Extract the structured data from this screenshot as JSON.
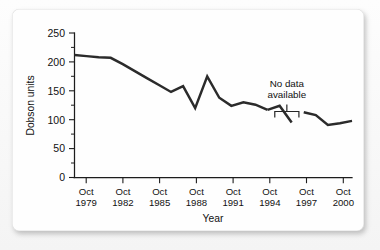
{
  "chart_data": {
    "type": "line",
    "title": "",
    "subtitle": "",
    "xlabel": "Year",
    "ylabel": "Dobson units",
    "ylim": [
      0,
      250
    ],
    "yticks": [
      0,
      50,
      100,
      150,
      200,
      250
    ],
    "ytick_labels": [
      "0",
      "50",
      "100",
      "150",
      "200",
      "250"
    ],
    "y_minor_ticks": [
      25,
      75,
      125,
      175,
      225
    ],
    "xlim": [
      1978,
      2001
    ],
    "xticks": [
      1979,
      1982,
      1985,
      1988,
      1991,
      1994,
      1997,
      2000
    ],
    "xtick_labels": [
      "Oct\n1979",
      "Oct\n1982",
      "Oct\n1985",
      "Oct\n1988",
      "Oct\n1991",
      "Oct\n1994",
      "Oct\n1997",
      "Oct\n2000"
    ],
    "xtick_labels_line1": [
      "Oct",
      "Oct",
      "Oct",
      "Oct",
      "Oct",
      "Oct",
      "Oct",
      "Oct"
    ],
    "xtick_labels_line2": [
      "1979",
      "1982",
      "1985",
      "1988",
      "1991",
      "1994",
      "1997",
      "2000"
    ],
    "grid": false,
    "legend": null,
    "legend_position": "none",
    "line_color": "#2b2b2b",
    "series": [
      {
        "name": "Antarctic ozone minimum",
        "segment": "pre-gap",
        "x": [
          1978,
          1979,
          1980,
          1981,
          1982,
          1983,
          1984,
          1985,
          1986,
          1987,
          1988,
          1989,
          1990,
          1991,
          1992,
          1993,
          1994
        ],
        "values": [
          212,
          210,
          208,
          207,
          196,
          184,
          172,
          160,
          148,
          158,
          120,
          175,
          138,
          124,
          130,
          126,
          117
        ]
      },
      {
        "name": "Antarctic ozone minimum",
        "segment": "pre-gap-tail",
        "x": [
          1994,
          1995,
          1996
        ],
        "values": [
          117,
          124,
          95
        ]
      },
      {
        "name": "Antarctic ozone minimum",
        "segment": "post-gap",
        "x": [
          1997,
          1998,
          1999,
          2000,
          2001
        ],
        "values": [
          113,
          108,
          91,
          94,
          98
        ]
      }
    ],
    "annotations": [
      {
        "text": "No data available",
        "text_line1": "No data",
        "text_line2": "available",
        "type": "gap-bracket",
        "x_start": 1994.6,
        "x_end": 1996.6
      }
    ]
  }
}
